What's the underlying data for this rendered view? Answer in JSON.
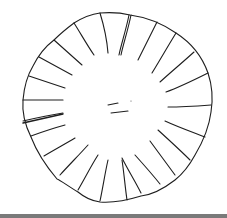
{
  "sketch": {
    "subject": "hand-drawn circle with radial spokes",
    "stroke_color": "#1e1e1e",
    "background_color": "#ffffff",
    "spoke_count": 24,
    "center_marks": 2
  },
  "bottom_strip": {
    "color": "#7a7a7a"
  }
}
